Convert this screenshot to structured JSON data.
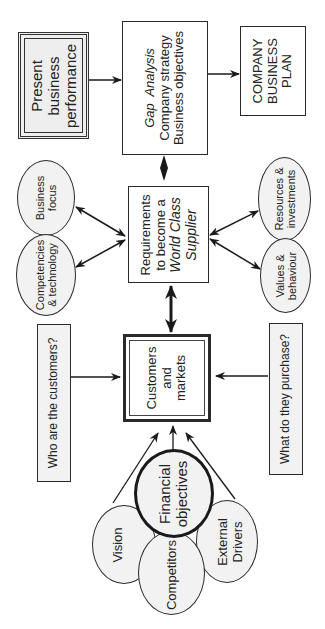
{
  "diagram": {
    "top_row": {
      "present": {
        "lines": [
          "Present",
          "business",
          "performance"
        ]
      },
      "gap": {
        "title": "Gap  Analysis",
        "lines": [
          "Company strategy",
          "Business objectives"
        ]
      },
      "plan": {
        "lines": [
          "COMPANY",
          "BUSINESS",
          "PLAN"
        ]
      }
    },
    "middle_row": {
      "business_focus": {
        "lines": [
          "Business",
          "focus"
        ]
      },
      "competencies": {
        "lines": [
          "Competencies",
          "& technology"
        ]
      },
      "requirements": {
        "line1": "Requirements",
        "line2": "to become a",
        "line3": "World Class",
        "line4": "Supplier"
      },
      "resources": {
        "lines": [
          "Resources &",
          "investments"
        ]
      },
      "values": {
        "lines": [
          "Values &",
          "behaviour"
        ]
      }
    },
    "lower_row": {
      "who": {
        "label": "Who are the customers?"
      },
      "customers": {
        "lines": [
          "Customers",
          "and",
          "markets"
        ]
      },
      "what": {
        "label": "What do they purchase?"
      }
    },
    "bottom_cluster": {
      "financial": {
        "lines": [
          "Financial",
          "objectives"
        ]
      },
      "vision": {
        "label": "Vision"
      },
      "competitors": {
        "label": "Competitors"
      },
      "external": {
        "lines": [
          "External",
          "Drivers"
        ]
      }
    },
    "colors": {
      "line": "#1a1a1a",
      "fill": "#f2f2f2",
      "background": "#ffffff"
    }
  }
}
